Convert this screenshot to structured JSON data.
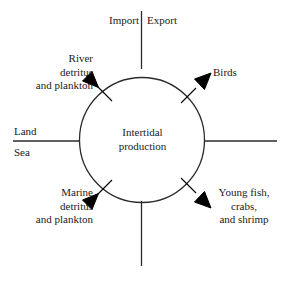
{
  "diagram": {
    "center_label": "Intertidal\nproduction",
    "background_color": "#ffffff",
    "stroke_color": "#2b2b2b",
    "arrow_color": "#000000",
    "axis_labels": {
      "import": "Import",
      "export": "Export",
      "land": "Land",
      "sea": "Sea"
    },
    "inputs": [
      {
        "id": "river-detritus",
        "label": "River\ndetritus\nand plankton",
        "direction": "into-circle",
        "quadrant": "upper-left"
      },
      {
        "id": "marine-detritus",
        "label": "Marine\ndetritus\nand plankton",
        "direction": "into-circle",
        "quadrant": "lower-left"
      }
    ],
    "outputs": [
      {
        "id": "birds",
        "label": "Birds",
        "direction": "out-of-circle",
        "quadrant": "upper-right"
      },
      {
        "id": "young-fish",
        "label": "Young fish,\ncrabs,\nand shrimp",
        "direction": "out-of-circle",
        "quadrant": "lower-right"
      }
    ]
  }
}
